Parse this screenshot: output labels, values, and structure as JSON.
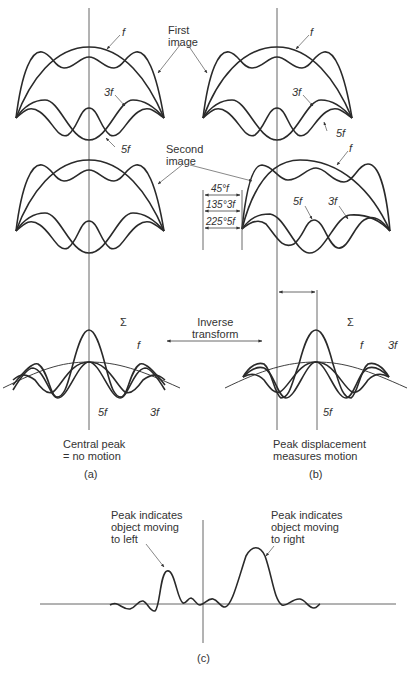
{
  "labels": {
    "first_image": "First\nimage",
    "second_image": "Second\nimage",
    "f": "f",
    "three_f": "3f",
    "five_f": "5f",
    "sigma": "Σ",
    "phase_45": "45°f",
    "phase_135": "135°3f",
    "phase_225": "225°5f",
    "inverse_transform": "Inverse\ntransform",
    "caption_a_text": "Central peak\n= no motion",
    "caption_b_text": "Peak displacement\nmeasures motion",
    "panel_a": "(a)",
    "panel_b": "(b)",
    "panel_c": "(c)",
    "peak_left": "Peak indicates\nobject moving\nto left",
    "peak_right": "Peak indicates\nobject moving\nto right"
  },
  "colors": {
    "curve": "#2a2a2a",
    "axis": "#555555",
    "text": "#333333",
    "background": "#ffffff"
  }
}
